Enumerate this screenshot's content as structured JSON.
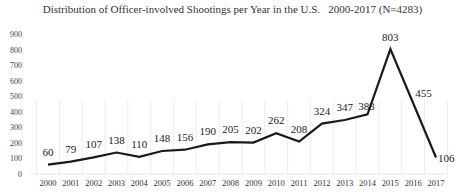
{
  "chart_data": {
    "type": "line",
    "title": "Distribution of Officer-involved Shootings per Year in the U.S.   2000-2017 (N=4283)",
    "xlabel": "",
    "ylabel": "",
    "categories": [
      "2000",
      "2001",
      "2002",
      "2003",
      "2004",
      "2005",
      "2006",
      "2007",
      "2008",
      "2009",
      "2010",
      "2011",
      "2012",
      "2013",
      "2014",
      "2015",
      "2016",
      "2017"
    ],
    "series": [
      {
        "name": "Officer-involved Shootings",
        "values": [
          60,
          79,
          107,
          138,
          110,
          148,
          156,
          190,
          205,
          202,
          262,
          208,
          324,
          347,
          383,
          803,
          455,
          106
        ]
      }
    ],
    "ylim": [
      0,
      900
    ],
    "yticks": [
      0,
      100,
      200,
      300,
      400,
      500,
      600,
      700,
      800,
      900
    ],
    "grid": "faint vertical lines between categories",
    "legend": "none",
    "data_labels": true,
    "line_color": "#1a1a1a"
  }
}
